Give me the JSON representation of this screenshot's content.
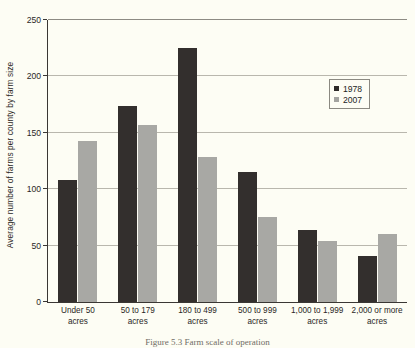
{
  "chart_data": {
    "type": "bar",
    "title": "",
    "xlabel": "",
    "ylabel": "Average number of farms per county by farm size",
    "ylim": [
      0,
      250
    ],
    "ytick_step": 50,
    "yticks": [
      0,
      50,
      100,
      150,
      200,
      250
    ],
    "ytick_labels": [
      "0",
      "50",
      "100",
      "150",
      "200",
      "250"
    ],
    "grid": "horizontal",
    "legend_position": "top-right-inside",
    "categories": [
      "Under 50\nacres",
      "50 to 179\nacres",
      "180 to 499\nacres",
      "500 to 999\nacres",
      "1,000 to 1,999\nacres",
      "2,000 or more\nacres"
    ],
    "category_lines": [
      [
        "Under 50",
        "acres"
      ],
      [
        "50 to 179",
        "acres"
      ],
      [
        "180 to 499",
        "acres"
      ],
      [
        "500 to 999",
        "acres"
      ],
      [
        "1,000 to 1,999",
        "acres"
      ],
      [
        "2,000 or more",
        "acres"
      ]
    ],
    "series": [
      {
        "name": "1978",
        "color": "#332f2d",
        "values": [
          108,
          174,
          225,
          115,
          64,
          41
        ]
      },
      {
        "name": "2007",
        "color": "#a8a8a4",
        "values": [
          143,
          157,
          129,
          75,
          54,
          60
        ]
      }
    ]
  },
  "legend": {
    "items": [
      {
        "label": "1978",
        "swatch": "sw-1978"
      },
      {
        "label": "2007",
        "swatch": "sw-2007"
      }
    ]
  },
  "caption": "Figure 5.3  Farm scale of operation"
}
